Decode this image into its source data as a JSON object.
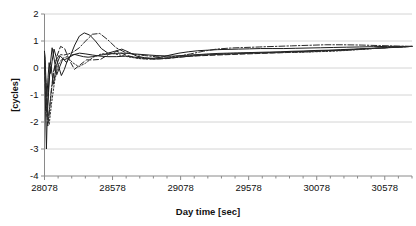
{
  "chart_data": {
    "type": "line",
    "title": "",
    "xlabel": "Day time [sec]",
    "ylabel": "[cycles]",
    "xlim": [
      28078,
      30778
    ],
    "ylim": [
      -4,
      2
    ],
    "xticks": [
      28078,
      28578,
      29078,
      29578,
      30078,
      30578
    ],
    "xtick_labels": [
      "28078",
      "28578",
      "29078",
      "29578",
      "30078",
      "30578"
    ],
    "yticks": [
      2,
      1,
      0,
      -1,
      -2,
      -3,
      -4
    ],
    "ytick_labels": [
      "2",
      "1",
      "0",
      "-1",
      "-2",
      "-3",
      "-4"
    ],
    "x_minor_ticks_per_major": 5,
    "grid": {
      "horizontal": true,
      "vertical": false,
      "color": "#c9c9c9"
    },
    "legend": {
      "visible": false,
      "position": "none"
    },
    "annotations": [],
    "series": [
      {
        "name": "series-1",
        "style": "solid",
        "color": "#1c1c1c",
        "x": [
          28078,
          28084,
          28090,
          28096,
          28104,
          28112,
          28122,
          28134,
          28148,
          28164,
          28182,
          28202,
          28224,
          28248,
          28274,
          28302,
          28332,
          28364,
          28398,
          28434,
          28472,
          28512,
          28554,
          28598,
          28644,
          28692,
          28742,
          28794,
          28848,
          28904,
          28962,
          29022,
          29084,
          29148,
          29214,
          29282,
          29352,
          29424,
          29498,
          29574,
          29652,
          29732,
          29814,
          29898,
          29984,
          30072,
          30162,
          30254,
          30348,
          30444,
          30542,
          30642,
          30744,
          30778
        ],
        "y": [
          0.6,
          0.1,
          -0.55,
          -1.05,
          -0.35,
          0.2,
          -0.2,
          0.25,
          0.7,
          0.4,
          0.05,
          -0.28,
          -0.05,
          0.3,
          0.48,
          0.5,
          0.46,
          0.42,
          0.4,
          0.42,
          0.46,
          0.5,
          0.52,
          0.54,
          0.55,
          0.54,
          0.52,
          0.5,
          0.48,
          0.46,
          0.45,
          0.44,
          0.46,
          0.48,
          0.5,
          0.52,
          0.54,
          0.55,
          0.56,
          0.57,
          0.58,
          0.59,
          0.6,
          0.62,
          0.63,
          0.65,
          0.66,
          0.68,
          0.7,
          0.72,
          0.74,
          0.76,
          0.79,
          0.8
        ]
      },
      {
        "name": "series-2",
        "style": "solid",
        "color": "#1c1c1c",
        "x": [
          28078,
          28084,
          28090,
          28098,
          28108,
          28120,
          28134,
          28150,
          28168,
          28190,
          28214,
          28240,
          28268,
          28300,
          28334,
          28370,
          28410,
          28452,
          28496,
          28544,
          28594,
          28646,
          28700,
          28756,
          28814,
          28874,
          28936,
          29000,
          29066,
          29134,
          29204,
          29276,
          29350,
          29426,
          29504,
          29584,
          29666,
          29750,
          29836,
          29924,
          30014,
          30106,
          30200,
          30296,
          30394,
          30494,
          30596,
          30700,
          30778
        ],
        "y": [
          0.62,
          -0.2,
          -1.0,
          -1.8,
          -0.9,
          0.1,
          0.75,
          0.3,
          -0.25,
          0.05,
          0.35,
          0.2,
          0.45,
          0.85,
          1.18,
          1.3,
          1.22,
          1.0,
          0.72,
          0.55,
          0.62,
          0.7,
          0.58,
          0.44,
          0.38,
          0.36,
          0.4,
          0.48,
          0.55,
          0.6,
          0.64,
          0.66,
          0.68,
          0.69,
          0.7,
          0.71,
          0.72,
          0.72,
          0.72,
          0.73,
          0.74,
          0.75,
          0.76,
          0.77,
          0.78,
          0.79,
          0.8,
          0.8,
          0.8
        ]
      },
      {
        "name": "series-3",
        "style": "solid",
        "color": "#1c1c1c",
        "x": [
          28078,
          28082,
          28086,
          28092,
          28100,
          28112,
          28126,
          28144,
          28166,
          28192,
          28222,
          28256,
          28294,
          28336,
          28382,
          28432,
          28486,
          28544,
          28606,
          28672,
          28742,
          28816,
          28894,
          28976,
          29062,
          29152,
          29246,
          29344,
          29446,
          29552,
          29662,
          29776,
          29894,
          30016,
          30142,
          30272,
          30406,
          30544,
          30686,
          30778
        ],
        "y": [
          0.55,
          -0.5,
          -1.6,
          -3.0,
          -1.4,
          -0.3,
          0.05,
          -0.6,
          0.1,
          0.45,
          0.3,
          0.38,
          0.5,
          0.55,
          0.52,
          0.48,
          0.44,
          0.42,
          0.42,
          0.44,
          0.4,
          0.36,
          0.34,
          0.36,
          0.4,
          0.44,
          0.48,
          0.5,
          0.52,
          0.54,
          0.56,
          0.58,
          0.6,
          0.62,
          0.64,
          0.66,
          0.7,
          0.74,
          0.78,
          0.8
        ]
      },
      {
        "name": "series-4",
        "style": "dashed",
        "color": "#242424",
        "x": [
          28078,
          28084,
          28092,
          28102,
          28114,
          28130,
          28148,
          28170,
          28196,
          28226,
          28260,
          28298,
          28340,
          28386,
          28436,
          28490,
          28548,
          28610,
          28676,
          28746,
          28820,
          28898,
          28980,
          29066,
          29156,
          29250,
          29348,
          29450,
          29556,
          29666,
          29780,
          29898,
          30020,
          30146,
          30276,
          30410,
          30548,
          30690,
          30778
        ],
        "y": [
          0.5,
          -0.7,
          -1.5,
          -2.15,
          -1.6,
          -0.8,
          -0.1,
          0.45,
          0.8,
          0.72,
          0.3,
          -0.05,
          0.12,
          0.3,
          0.3,
          0.32,
          0.5,
          0.62,
          0.48,
          0.38,
          0.34,
          0.33,
          0.35,
          0.4,
          0.44,
          0.46,
          0.48,
          0.5,
          0.52,
          0.54,
          0.56,
          0.58,
          0.6,
          0.63,
          0.66,
          0.7,
          0.74,
          0.78,
          0.8
        ]
      },
      {
        "name": "series-5",
        "style": "dashdot",
        "color": "#2a2a2a",
        "x": [
          28078,
          28086,
          28096,
          28108,
          28124,
          28142,
          28164,
          28190,
          28220,
          28254,
          28292,
          28334,
          28380,
          28430,
          28484,
          28542,
          28604,
          28670,
          28740,
          28814,
          28892,
          28974,
          29060,
          29150,
          29244,
          29342,
          29444,
          29550,
          29660,
          29774,
          29892,
          30014,
          30140,
          30270,
          30404,
          30542,
          30684,
          30778
        ],
        "y": [
          0.58,
          -0.4,
          -1.2,
          -1.9,
          -1.0,
          -0.2,
          0.3,
          0.5,
          0.48,
          0.52,
          0.6,
          0.75,
          1.0,
          1.25,
          1.28,
          1.05,
          0.75,
          0.58,
          0.5,
          0.46,
          0.42,
          0.4,
          0.44,
          0.52,
          0.62,
          0.7,
          0.74,
          0.76,
          0.78,
          0.8,
          0.82,
          0.84,
          0.86,
          0.86,
          0.85,
          0.83,
          0.81,
          0.8
        ]
      },
      {
        "name": "series-6",
        "style": "dotted",
        "color": "#303030",
        "x": [
          28078,
          28086,
          28098,
          28112,
          28130,
          28152,
          28178,
          28208,
          28244,
          28284,
          28330,
          28380,
          28436,
          28496,
          28562,
          28632,
          28708,
          28788,
          28872,
          28960,
          29052,
          29148,
          29248,
          29352,
          29460,
          29572,
          29688,
          29808,
          29932,
          30060,
          30192,
          30328,
          30468,
          30612,
          30778
        ],
        "y": [
          0.52,
          -0.6,
          -1.7,
          -2.1,
          -1.3,
          -0.5,
          0.1,
          0.35,
          0.42,
          0.2,
          0.05,
          0.18,
          0.4,
          0.52,
          0.55,
          0.48,
          0.4,
          0.34,
          0.33,
          0.36,
          0.42,
          0.46,
          0.5,
          0.52,
          0.54,
          0.55,
          0.56,
          0.57,
          0.58,
          0.6,
          0.62,
          0.66,
          0.71,
          0.76,
          0.8
        ]
      }
    ]
  }
}
